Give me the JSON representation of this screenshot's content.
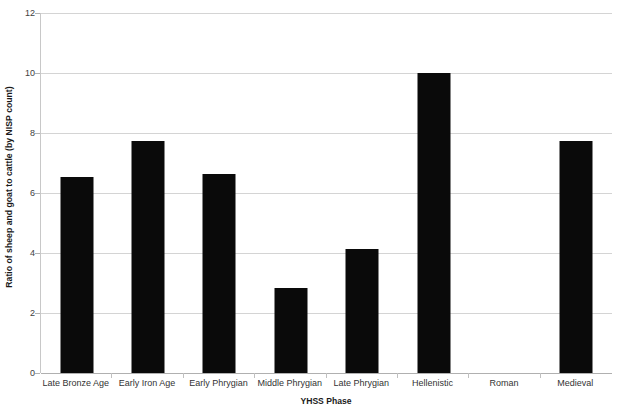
{
  "chart_data": {
    "type": "bar",
    "title": "",
    "xlabel": "YHSS Phase",
    "ylabel": "Ratio of sheep and goat to cattle (by NISP count)",
    "categories": [
      "Late Bronze Age",
      "Early Iron Age",
      "Early Phrygian",
      "Middle Phrygian",
      "Late Phrygian",
      "Hellenistic",
      "Roman",
      "Medieval"
    ],
    "values": [
      6.55,
      7.75,
      6.63,
      2.83,
      4.13,
      10.0,
      0,
      7.72
    ],
    "ylim": [
      0,
      12
    ],
    "ytick_values": [
      0,
      2,
      4,
      6,
      8,
      10,
      12
    ],
    "ytick_labels": [
      "0",
      "2",
      "4",
      "6",
      "8",
      "10",
      "12"
    ],
    "grid": true,
    "grid_axis": "y",
    "legend": false,
    "legend_position": "none",
    "bar_color": "#0a0a0a",
    "gridline_color": "#d4d4d4",
    "axis_color": "#b0b0b0",
    "background_color": "#ffffff"
  }
}
